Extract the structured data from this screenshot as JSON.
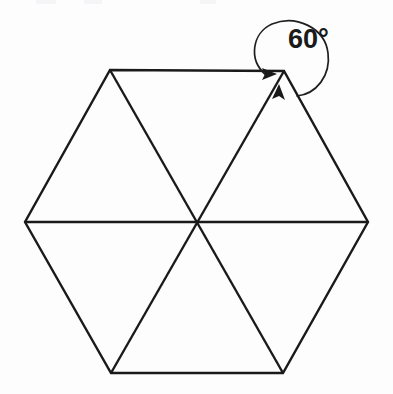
{
  "figure": {
    "title": "Regular hexagon divided into six equilateral triangles",
    "shape_name": "regular-hexagon",
    "background_color": "#fdfdfd",
    "stroke_color": "#1a1a1a",
    "stroke_width": 2.4,
    "triangle_count": 6
  },
  "geometry": {
    "center": {
      "x": 197,
      "y": 222
    },
    "vertices": [
      {
        "name": "top-left",
        "x": 110,
        "y": 70
      },
      {
        "name": "top-right",
        "x": 284,
        "y": 71
      },
      {
        "name": "right",
        "x": 368,
        "y": 222
      },
      {
        "name": "bottom-right",
        "x": 283,
        "y": 373
      },
      {
        "name": "bottom-left",
        "x": 111,
        "y": 373
      },
      {
        "name": "left",
        "x": 25,
        "y": 222
      }
    ],
    "diagonals": [
      {
        "name": "horizontal-diagonal",
        "from": "left",
        "to": "right"
      },
      {
        "name": "diagonal-tl-br",
        "from": "top-left",
        "to": "bottom-right"
      },
      {
        "name": "diagonal-tr-bl",
        "from": "top-right",
        "to": "bottom-left"
      }
    ]
  },
  "annotation": {
    "angle_label": "60°",
    "angle_value": 60,
    "angle_unit": "degrees",
    "marked_vertex": "top-right",
    "label_position": {
      "x": 288,
      "y": 48
    },
    "arc_color": "#1f1f1f",
    "arc_width": 1.7,
    "arrow_count": 2,
    "arrow_targets": [
      "top-edge",
      "upper-right-diagonal"
    ]
  }
}
